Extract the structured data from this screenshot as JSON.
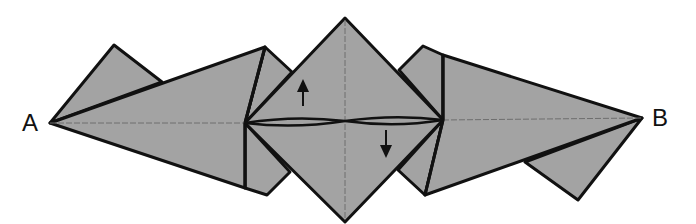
{
  "diagram": {
    "type": "origami-fold-step",
    "colors": {
      "paper": "#a3a3a3",
      "edge": "#111111",
      "crease": "#6e6e6e",
      "background": "#ffffff"
    },
    "labels": {
      "a": "A",
      "b": "B"
    },
    "arrows": [
      {
        "name": "arrow-up",
        "direction": "up",
        "x": 303,
        "y_from": 104,
        "y_to": 81
      },
      {
        "name": "arrow-down",
        "direction": "down",
        "x": 386,
        "y_from": 132,
        "y_to": 156
      }
    ],
    "points": {
      "A": [
        50,
        123
      ],
      "B": [
        642,
        118
      ],
      "center_top": [
        345,
        18
      ],
      "center_bottom": [
        345,
        222
      ],
      "center_left": [
        245,
        123
      ],
      "center_right": [
        443,
        120
      ]
    }
  }
}
